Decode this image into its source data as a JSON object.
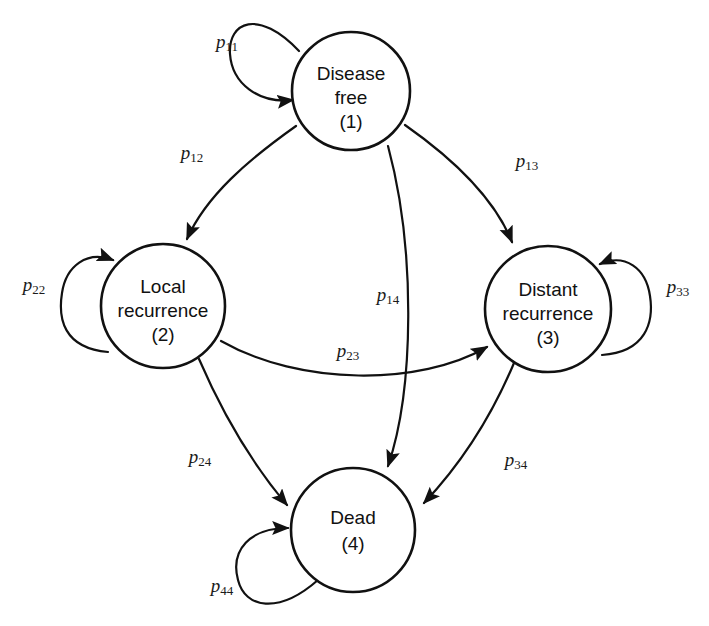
{
  "diagram": {
    "type": "state-transition-diagram",
    "background_color": "#ffffff",
    "stroke_color": "#111111",
    "states": [
      {
        "id": "1",
        "name": "disease-free",
        "line1": "Disease",
        "line2": "free",
        "line3": "(1)",
        "cx": 351,
        "cy": 91,
        "r": 59
      },
      {
        "id": "2",
        "name": "local-recurrence",
        "line1": "Local",
        "line2": "recurrence",
        "line3": "(2)",
        "cx": 163,
        "cy": 306,
        "r": 62
      },
      {
        "id": "3",
        "name": "distant-recurrence",
        "line1": "Distant",
        "line2": "recurrence",
        "line3": "(3)",
        "cx": 548,
        "cy": 309,
        "r": 63
      },
      {
        "id": "4",
        "name": "dead",
        "line1": "Dead",
        "line2": "(4)",
        "line3": "",
        "cx": 353,
        "cy": 530,
        "r": 62
      }
    ],
    "self_loops": [
      {
        "id": "p11",
        "from": "1",
        "to": "1",
        "base": "p",
        "sub": "11",
        "label_x": 227,
        "label_y": 44
      },
      {
        "id": "p22",
        "from": "2",
        "to": "2",
        "base": "p",
        "sub": "22",
        "label_x": 34,
        "label_y": 287
      },
      {
        "id": "p33",
        "from": "3",
        "to": "3",
        "base": "p",
        "sub": "33",
        "label_x": 678,
        "label_y": 289
      },
      {
        "id": "p44",
        "from": "4",
        "to": "4",
        "base": "p",
        "sub": "44",
        "label_x": 222,
        "label_y": 588
      }
    ],
    "transitions": [
      {
        "id": "p12",
        "from": "1",
        "to": "2",
        "base": "p",
        "sub": "12",
        "label_x": 192,
        "label_y": 155
      },
      {
        "id": "p13",
        "from": "1",
        "to": "3",
        "base": "p",
        "sub": "13",
        "label_x": 527,
        "label_y": 163
      },
      {
        "id": "p14",
        "from": "1",
        "to": "4",
        "base": "p",
        "sub": "14",
        "label_x": 388,
        "label_y": 297
      },
      {
        "id": "p23",
        "from": "2",
        "to": "3",
        "base": "p",
        "sub": "23",
        "label_x": 348,
        "label_y": 353
      },
      {
        "id": "p24",
        "from": "2",
        "to": "4",
        "base": "p",
        "sub": "24",
        "label_x": 200,
        "label_y": 459
      },
      {
        "id": "p34",
        "from": "3",
        "to": "4",
        "base": "p",
        "sub": "34",
        "label_x": 516,
        "label_y": 462
      }
    ]
  }
}
